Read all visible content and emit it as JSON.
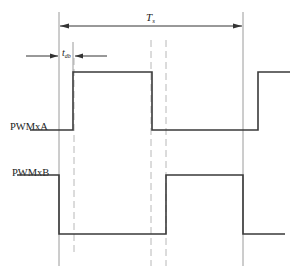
{
  "diagram": {
    "type": "timing-diagram",
    "period_label": "T",
    "period_subscript": "s",
    "deadband_label": "t",
    "deadband_subscript": "db",
    "signals": [
      {
        "name": "PWMxA",
        "label": "PWMxA",
        "initial_level": "low",
        "transitions": [
          "rise",
          "fall",
          "rise"
        ]
      },
      {
        "name": "PWMxB",
        "label": "PWMxB",
        "initial_level": "high",
        "transitions": [
          "fall",
          "rise",
          "fall"
        ]
      }
    ]
  }
}
